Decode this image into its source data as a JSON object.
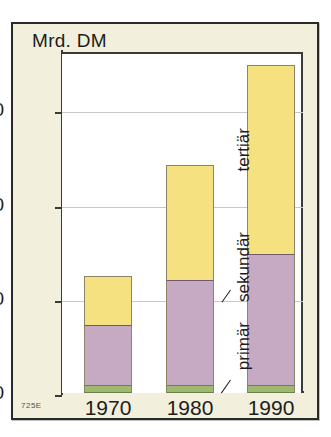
{
  "figure": {
    "unit_title": "Mrd. DM",
    "source_code": "725E",
    "colors": {
      "card_background": "#f2efdc",
      "plot_background": "#ffffff",
      "frame": "#2a2a28",
      "tertiaer": "#f5e17f",
      "sekundaer": "#c6a9c2",
      "primaer": "#9fb870",
      "gridline": "#c9c9c4",
      "text": "#1d1d1b"
    }
  },
  "chart_data": {
    "type": "bar",
    "stacked": true,
    "title": "Mrd. DM",
    "xlabel": "",
    "ylabel": "Mrd. DM",
    "categories": [
      "1970",
      "1980",
      "1990"
    ],
    "ytick_labels": [
      "0",
      "50",
      "100",
      "150"
    ],
    "yticks": [
      0,
      50,
      100,
      150
    ],
    "ylim": [
      0,
      181
    ],
    "grid": true,
    "legend_position": "inline-annotations",
    "series": [
      {
        "name": "primär",
        "values": [
          4,
          4,
          4
        ]
      },
      {
        "name": "sekundär",
        "values": [
          32,
          56,
          70
        ]
      },
      {
        "name": "tertiär",
        "values": [
          26,
          61,
          100
        ]
      }
    ],
    "totals": [
      62,
      121,
      174
    ],
    "annotations": [
      {
        "label": "tertiär",
        "series": "tertiär"
      },
      {
        "label": "sekundär",
        "series": "sekundär"
      },
      {
        "label": "primär",
        "series": "primär"
      }
    ]
  }
}
